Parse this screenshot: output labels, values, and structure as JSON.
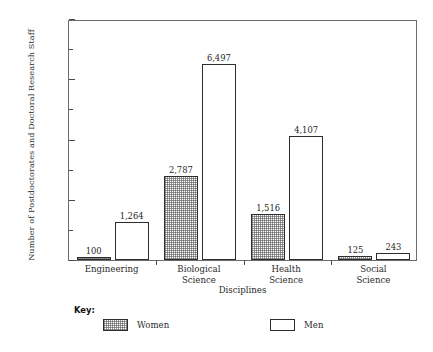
{
  "chart_data": {
    "type": "bar",
    "title": "",
    "xlabel": "Disciplines",
    "ylabel": "Number of Postdoctorates and Doctoral Research Staff",
    "categories": [
      "Engineering",
      "Biological Science",
      "Health Science",
      "Social Science"
    ],
    "series": [
      {
        "name": "Women",
        "values": [
          100,
          2787,
          1516,
          125
        ],
        "labels": [
          "100",
          "2,787",
          "1,516",
          "125"
        ],
        "fill": "crosshatch",
        "color": "#ffffff"
      },
      {
        "name": "Men",
        "values": [
          1264,
          6497,
          4107,
          243
        ],
        "labels": [
          "1,264",
          "6,497",
          "4,107",
          "243"
        ],
        "fill": "solid",
        "color": "#ffffff"
      }
    ],
    "ylim": [
      0,
      8000
    ],
    "ytick_values": [
      0,
      2000,
      4000,
      6000,
      8000
    ],
    "ytick_labels": [
      "0",
      "2,000",
      "4,000",
      "6,000",
      "8,000"
    ],
    "yminor_values": [
      1000,
      3000,
      5000,
      7000
    ],
    "grid": false,
    "legend_position": "below-plot"
  },
  "axis": {
    "y_title": "Number of Postdoctorates and Doctoral Research Staff",
    "x_title": "Disciplines",
    "ticks": [
      {
        "label": "8,000",
        "value": 8000,
        "major": true
      },
      {
        "label": "",
        "value": 7000,
        "major": false
      },
      {
        "label": "6,000",
        "value": 6000,
        "major": true
      },
      {
        "label": "",
        "value": 5000,
        "major": false
      },
      {
        "label": "4,000",
        "value": 4000,
        "major": true
      },
      {
        "label": "",
        "value": 3000,
        "major": false
      },
      {
        "label": "2,000",
        "value": 2000,
        "major": true
      },
      {
        "label": "",
        "value": 1000,
        "major": false
      },
      {
        "label": "0",
        "value": 0,
        "major": true
      }
    ],
    "categories": [
      {
        "line1": "Engineering",
        "line2": ""
      },
      {
        "line1": "Biological",
        "line2": "Science"
      },
      {
        "line1": "Health",
        "line2": "Science"
      },
      {
        "line1": "Social",
        "line2": "Science"
      }
    ]
  },
  "legend": {
    "key_label": "Key:",
    "entries": [
      {
        "label": "Women",
        "fill": "crosshatch"
      },
      {
        "label": "Men",
        "fill": "solid"
      }
    ]
  },
  "colors": {
    "frame": "#6c6c6c",
    "bar_outline": "#2d2d2d",
    "hatch": "#5a5a5a",
    "text": "#2b2b2b",
    "background": "#ffffff"
  }
}
